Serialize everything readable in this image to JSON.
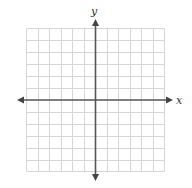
{
  "diagram": {
    "type": "coordinate-grid",
    "x_label": "x",
    "y_label": "y",
    "grid_columns": 12,
    "grid_rows": 12,
    "colors": {
      "grid": "#d4d4d4",
      "axis": "#555555",
      "label": "#333333"
    }
  }
}
